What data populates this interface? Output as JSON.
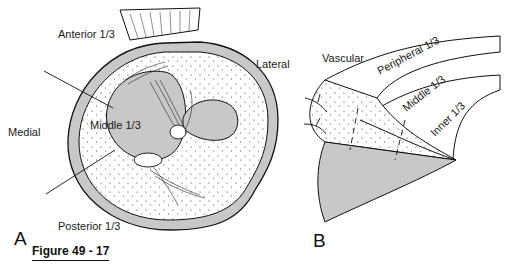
{
  "figure": {
    "caption": "Figure 49 - 17"
  },
  "panel_a": {
    "letter": "A",
    "labels": {
      "anterior": "Anterior 1/3",
      "lateral": "Lateral",
      "medial": "Medial",
      "middle": "Middle 1/3",
      "posterior": "Posterior 1/3"
    }
  },
  "panel_b": {
    "letter": "B",
    "labels": {
      "vascular": "Vascular",
      "peripheral": "Peripheral 1/3",
      "middle": "Middle 1/3",
      "inner": "Inner 1/3"
    }
  },
  "colors": {
    "tissue_gray": "#c8c8c8",
    "ink": "#111111",
    "background": "#ffffff"
  }
}
